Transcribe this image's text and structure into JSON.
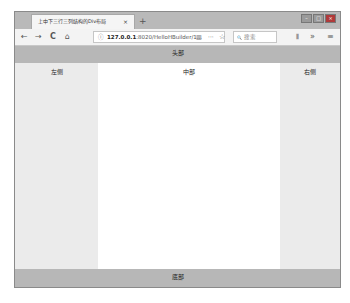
{
  "browser": {
    "tab_title": "上中下三行三列结构的Div布局",
    "tab_close": "×",
    "new_tab": "+",
    "window_controls": {
      "minimize": "–",
      "maximize": "□",
      "close": "×"
    },
    "nav": {
      "back": "←",
      "forward": "→",
      "reload": "C",
      "home": "⌂"
    },
    "url": {
      "info_icon": "ⓘ",
      "host": "127.0.0.1",
      "path": ":8020/HelloHBuilder/1..."
    },
    "reader_icon": "▥",
    "more_icon": "···",
    "bookmark_icon": "☆",
    "search": {
      "icon": "🔍",
      "placeholder": "搜索"
    },
    "library_icon": "⫴",
    "overflow_icon": "»",
    "menu_icon": "≡"
  },
  "page": {
    "header": "头部",
    "left": "左侧",
    "middle": "中部",
    "right": "右侧",
    "footer": "底部"
  }
}
